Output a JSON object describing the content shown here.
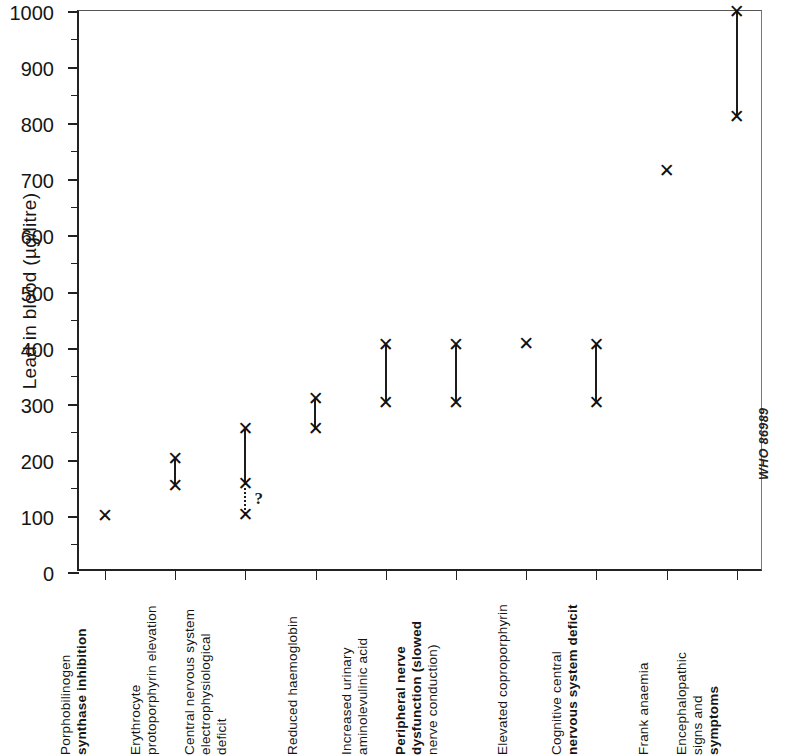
{
  "figure": {
    "credit": "WHO 86989"
  },
  "chart_data": {
    "type": "scatter",
    "title": "",
    "xlabel": "",
    "ylabel": "Lead in blood (µg/litre)",
    "ylim": [
      0,
      1000
    ],
    "ytick_major": [
      0,
      100,
      200,
      300,
      400,
      500,
      600,
      700,
      800,
      900,
      1000
    ],
    "ytick_major_labels": [
      "0",
      "100",
      "200",
      "300",
      "400",
      "500",
      "600",
      "700",
      "800",
      "900",
      "1000"
    ],
    "ytick_minor": [
      50,
      150,
      250,
      350,
      450,
      550,
      650,
      750,
      850,
      950
    ],
    "grid": false,
    "legend": null,
    "marker": "x",
    "categories": [
      "Porphobilinogen synthase inhibition",
      "Erythrocyte protoporphyrin elevation",
      "Central nervous system electrophysiological deficit",
      "Reduced haemoglobin",
      "Increased urinary aminolevulinic acid",
      "Peripheral nerve dysfunction (slowed nerve conduction)",
      "Elevated coproporphyrin",
      "Cognitive central nervous system deficit",
      "Frank anaemia",
      "Encephalopathic signs and symptoms"
    ],
    "category_lines": [
      [
        {
          "text": "Porphobilinogen",
          "bold": false
        },
        {
          "text": "synthase inhibition",
          "bold": true
        }
      ],
      [
        {
          "text": "Erythrocyte",
          "bold": false
        },
        {
          "text": "protoporphyrin elevation",
          "bold": false
        }
      ],
      [
        {
          "text": "Central nervous system",
          "bold": false
        },
        {
          "text": "electrophysiological",
          "bold": false
        },
        {
          "text": "deficit",
          "bold": false
        }
      ],
      [
        {
          "text": "Reduced haemoglobin",
          "bold": false
        }
      ],
      [
        {
          "text": "Increased urinary",
          "bold": false
        },
        {
          "text": "aminolevulinic acid",
          "bold": false
        }
      ],
      [
        {
          "text": "Peripheral nerve",
          "bold": true
        },
        {
          "text": "dysfunction (slowed",
          "bold": true
        },
        {
          "text": "nerve conduction)",
          "bold": false
        }
      ],
      [
        {
          "text": "Elevated coproporphyrin",
          "bold": false
        }
      ],
      [
        {
          "text": "Cognitive central",
          "bold": false
        },
        {
          "text": "nervous system deficit",
          "bold": true
        }
      ],
      [
        {
          "text": "Frank anaemia",
          "bold": false
        }
      ],
      [
        {
          "text": "Encephalopathic",
          "bold": false
        },
        {
          "text": "signs and ",
          "bold": false
        },
        {
          "text": "symptoms",
          "bold": true
        }
      ]
    ],
    "points": [
      {
        "category": "Porphobilinogen synthase inhibition",
        "low": 100,
        "high": 100,
        "uncertain_low": null,
        "uncertain": false
      },
      {
        "category": "Erythrocyte protoporphyrin elevation",
        "low": 155,
        "high": 203,
        "uncertain_low": null,
        "uncertain": false
      },
      {
        "category": "Central nervous system electrophysiological deficit",
        "low": 158,
        "high": 255,
        "uncertain_low": 103,
        "uncertain": true
      },
      {
        "category": "Reduced haemoglobin",
        "low": 255,
        "high": 310,
        "uncertain_low": null,
        "uncertain": false
      },
      {
        "category": "Increased urinary aminolevulinic acid",
        "low": 303,
        "high": 406,
        "uncertain_low": null,
        "uncertain": false
      },
      {
        "category": "Peripheral nerve dysfunction (slowed nerve conduction)",
        "low": 303,
        "high": 405,
        "uncertain_low": null,
        "uncertain": false
      },
      {
        "category": "Elevated coproporphyrin",
        "low": 408,
        "high": 408,
        "uncertain_low": null,
        "uncertain": false
      },
      {
        "category": "Cognitive central nervous system deficit",
        "low": 303,
        "high": 405,
        "uncertain_low": null,
        "uncertain": false
      },
      {
        "category": "Frank anaemia",
        "low": 715,
        "high": 715,
        "uncertain_low": null,
        "uncertain": false
      },
      {
        "category": "Encephalopathic signs and symptoms",
        "low": 812,
        "high": 1000,
        "uncertain_low": null,
        "uncertain": false
      }
    ],
    "uncertainty_symbol": "?",
    "marker_glyph": "✕"
  }
}
